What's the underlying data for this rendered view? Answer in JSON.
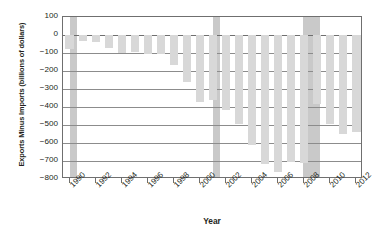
{
  "chart_data": {
    "type": "bar",
    "title": "",
    "subtitle": "",
    "xlabel": "Year",
    "ylabel": "Exports Minus Imports (billions of dollars)",
    "xlim": [
      1989.5,
      2012.5
    ],
    "ylim": [
      -800,
      100
    ],
    "ytick_step": 100,
    "grid": true,
    "legend": false,
    "bar_color": "#d8d8d8",
    "recession_band_color": "#c9c9c9",
    "axis_color": "#6f6f6f",
    "gridline_color": "#8c8c8c",
    "yticks": [
      100,
      0,
      -100,
      -200,
      -300,
      -400,
      -500,
      -600,
      -700,
      -800
    ],
    "ytick_labels": [
      "100",
      "0",
      "-100",
      "-200",
      "-300",
      "-400",
      "-500",
      "-600",
      "-700",
      "-800"
    ],
    "xtick_labels": [
      "1990",
      "1992",
      "1994",
      "1996",
      "1998",
      "2000",
      "2002",
      "2004",
      "2006",
      "2008",
      "2010",
      "2012"
    ],
    "xticks": [
      1990,
      1992,
      1994,
      1996,
      1998,
      2000,
      2002,
      2004,
      2006,
      2008,
      2010,
      2012
    ],
    "categories": [
      1990,
      1991,
      1992,
      1993,
      1994,
      1995,
      1996,
      1997,
      1998,
      1999,
      2000,
      2001,
      2002,
      2003,
      2004,
      2005,
      2006,
      2007,
      2008,
      2009,
      2010,
      2011,
      2012
    ],
    "values": [
      -80,
      -31,
      -39,
      -70,
      -98,
      -96,
      -104,
      -108,
      -166,
      -259,
      -372,
      -361,
      -418,
      -494,
      -610,
      -714,
      -762,
      -705,
      -709,
      -384,
      -494,
      -548,
      -540
    ],
    "annotations": [
      {
        "label": "recession-band-1990",
        "start": 1990.0,
        "end": 1990.6
      },
      {
        "label": "recession-band-2001",
        "start": 2001.0,
        "end": 2001.5
      },
      {
        "label": "recession-band-2008",
        "start": 2007.9,
        "end": 2009.2
      }
    ]
  }
}
